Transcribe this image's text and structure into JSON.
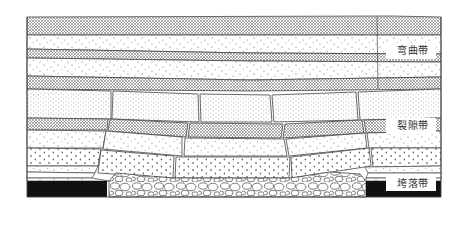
{
  "zones": [
    {
      "id": "bending",
      "label": "弯曲带",
      "top": 17,
      "bottom": 90
    },
    {
      "id": "fracture",
      "label": "裂隙带",
      "top": 90,
      "bottom": 165
    },
    {
      "id": "caving",
      "label": "垮落带",
      "top": 165,
      "bottom": 197
    }
  ],
  "labels": {
    "bending": "弯曲带",
    "fracture": "裂隙带",
    "caving": "垮落带"
  },
  "colors": {
    "line": "#444444",
    "coal": "#111111",
    "background": "#ffffff",
    "label_bg": "#ffffff"
  },
  "frame": {
    "x": 27,
    "y": 17,
    "width": 414,
    "height": 180
  },
  "coal_seam": {
    "left": {
      "x": 27,
      "width": 80,
      "y": 181,
      "height": 16
    },
    "right": {
      "x": 366,
      "width": 75,
      "y": 181,
      "height": 16
    }
  }
}
